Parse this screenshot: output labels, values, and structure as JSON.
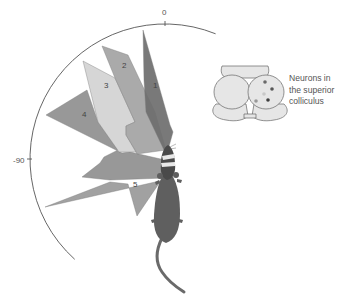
{
  "figure": {
    "type": "receptive-field-diagram",
    "axis": {
      "center": [
        165,
        159
      ],
      "radius": 135,
      "arc_start_deg": -138,
      "arc_end_deg": 22,
      "color": "#555555",
      "ticks": [
        {
          "label": "0",
          "angle_deg": 0
        },
        {
          "label": "-90",
          "angle_deg": -90
        }
      ]
    },
    "receptive_fields": [
      {
        "id": "4",
        "label": "4",
        "color": "#8f8f8f",
        "points": [
          [
            46,
            115
          ],
          [
            87,
            90
          ],
          [
            98,
            122
          ],
          [
            118,
            150
          ],
          [
            104,
            157
          ],
          [
            100,
            163
          ],
          [
            82,
            177
          ],
          [
            110,
            180
          ],
          [
            165,
            178
          ],
          [
            165,
            160
          ],
          [
            130,
            152
          ],
          [
            122,
            153
          ]
        ],
        "label_pos": [
          82,
          117
        ]
      },
      {
        "id": "5",
        "label": "5",
        "color": "#999999",
        "points": [
          [
            45,
            207
          ],
          [
            110,
            182
          ],
          [
            128,
            184
          ],
          [
            137,
            216
          ],
          [
            160,
            182
          ],
          [
            164,
            180
          ]
        ],
        "label_pos": [
          133,
          187
        ]
      },
      {
        "id": "3",
        "label": "3",
        "color": "#d2d2d2",
        "points": [
          [
            83,
            61
          ],
          [
            115,
            78
          ],
          [
            135,
            122
          ],
          [
            126,
            126
          ],
          [
            126,
            135
          ],
          [
            137,
            152
          ],
          [
            119,
            152
          ],
          [
            98,
            122
          ]
        ],
        "label_pos": [
          104,
          88
        ]
      },
      {
        "id": "2",
        "label": "2",
        "color": "#a3a3a3",
        "points": [
          [
            102,
            46
          ],
          [
            128,
            55
          ],
          [
            155,
            112
          ],
          [
            166,
            150
          ],
          [
            137,
            154
          ],
          [
            126,
            135
          ],
          [
            126,
            126
          ],
          [
            135,
            122
          ],
          [
            115,
            78
          ]
        ],
        "label_pos": [
          122,
          68
        ]
      },
      {
        "id": "1",
        "label": "1",
        "color": "#6e6e6e",
        "points": [
          [
            143,
            30
          ],
          [
            170,
            125
          ],
          [
            173,
            132
          ],
          [
            168,
            150
          ],
          [
            164,
            150
          ],
          [
            146,
            112
          ],
          [
            144,
            80
          ]
        ],
        "label_pos": [
          153,
          88
        ]
      }
    ],
    "mouse": {
      "body_color": "#5f5f5f",
      "head_color": "#4a4a4a",
      "stripe_color": "#e8e8e8",
      "tail_color": "#6a6a6a"
    },
    "brain": {
      "fill": "#e6e6e6",
      "stroke": "#666666",
      "neuron_dots": [
        {
          "x": 265,
          "y": 82,
          "color": "#6a6a6a"
        },
        {
          "x": 272,
          "y": 89,
          "color": "#555555"
        },
        {
          "x": 264,
          "y": 94,
          "color": "#c8c8c8"
        },
        {
          "x": 256,
          "y": 101,
          "color": "#999999"
        },
        {
          "x": 268,
          "y": 100,
          "color": "#3e3e3e"
        }
      ]
    },
    "caption_lines": [
      "Neurons in",
      "the superior",
      "colliculus"
    ]
  }
}
